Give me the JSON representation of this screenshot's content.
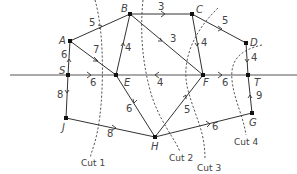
{
  "diagram": {
    "type": "network-flow-cuts",
    "nodes": [
      {
        "id": "A",
        "label": "A",
        "x": 70,
        "y": 41,
        "lx": 59,
        "ly": 44
      },
      {
        "id": "B",
        "label": "B",
        "x": 130,
        "y": 14,
        "lx": 121,
        "ly": 12
      },
      {
        "id": "C",
        "label": "C",
        "x": 192,
        "y": 14,
        "lx": 196,
        "ly": 13
      },
      {
        "id": "D",
        "label": "D",
        "x": 246,
        "y": 43,
        "lx": 250,
        "ly": 46
      },
      {
        "id": "S",
        "label": "S",
        "x": 68,
        "y": 75,
        "lx": 59,
        "ly": 74
      },
      {
        "id": "E",
        "label": "E",
        "x": 116,
        "y": 75,
        "lx": 124,
        "ly": 86
      },
      {
        "id": "F",
        "label": "F",
        "x": 203,
        "y": 75,
        "lx": 203,
        "ly": 86
      },
      {
        "id": "T",
        "label": "T",
        "x": 248,
        "y": 75,
        "lx": 254,
        "ly": 86
      },
      {
        "id": "J",
        "label": "J",
        "x": 66,
        "y": 118,
        "lx": 62,
        "ly": 131
      },
      {
        "id": "H",
        "label": "H",
        "x": 155,
        "y": 137,
        "lx": 151,
        "ly": 150
      },
      {
        "id": "G",
        "label": "G",
        "x": 252,
        "y": 113,
        "lx": 249,
        "ly": 126
      }
    ],
    "edges": [
      {
        "from": "A",
        "to": "B",
        "weight": "5",
        "wx": 89,
        "wy": 26
      },
      {
        "from": "A",
        "to": "E",
        "weight": "7",
        "wx": 93,
        "wy": 53
      },
      {
        "from": "S",
        "to": "A",
        "weight": "6",
        "wx": 61,
        "wy": 58
      },
      {
        "from": "S",
        "to": "E",
        "weight": "6",
        "wx": 90,
        "wy": 86
      },
      {
        "from": "S",
        "to": "J",
        "weight": "8",
        "wx": 57,
        "wy": 98
      },
      {
        "from": "E",
        "to": "B",
        "weight": "4",
        "wx": 125,
        "wy": 51
      },
      {
        "from": "B",
        "to": "C",
        "weight": "3",
        "wx": 158,
        "wy": 10
      },
      {
        "from": "B",
        "to": "F",
        "weight": "3",
        "wx": 170,
        "wy": 42
      },
      {
        "from": "C",
        "to": "F",
        "weight": "4",
        "wx": 201,
        "wy": 46
      },
      {
        "from": "C",
        "to": "D",
        "weight": "5",
        "wx": 222,
        "wy": 24
      },
      {
        "from": "D",
        "to": "T",
        "weight": "4",
        "wx": 251,
        "wy": 61
      },
      {
        "from": "F",
        "to": "E",
        "weight": "4",
        "wx": 157,
        "wy": 86
      },
      {
        "from": "F",
        "to": "T",
        "weight": "6",
        "wx": 222,
        "wy": 86
      },
      {
        "from": "E",
        "to": "H",
        "weight": "6",
        "wx": 126,
        "wy": 112
      },
      {
        "from": "H",
        "to": "F",
        "weight": "5",
        "wx": 184,
        "wy": 113
      },
      {
        "from": "J",
        "to": "H",
        "weight": "8",
        "wx": 107,
        "wy": 137
      },
      {
        "from": "H",
        "to": "G",
        "weight": "6",
        "wx": 212,
        "wy": 130
      },
      {
        "from": "G",
        "to": "T",
        "weight": "9",
        "wx": 256,
        "wy": 99
      }
    ],
    "cuts": [
      {
        "label": "Cut 1",
        "lx": 81,
        "ly": 166
      },
      {
        "label": "Cut 2",
        "lx": 169,
        "ly": 161
      },
      {
        "label": "Cut 3",
        "lx": 197,
        "ly": 171
      },
      {
        "label": "Cut 4",
        "lx": 234,
        "ly": 145
      }
    ],
    "baseline": {
      "x1": 10,
      "x2": 297,
      "y": 75
    }
  }
}
